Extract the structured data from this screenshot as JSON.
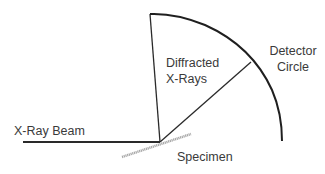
{
  "diagram": {
    "labels": {
      "diffracted_line1": "Diffracted",
      "diffracted_line2": "X-Rays",
      "detector_line1": "Detector",
      "detector_line2": "Circle",
      "beam": "X-Ray Beam",
      "specimen": "Specimen"
    },
    "colors": {
      "lines": "#2a2a2a",
      "specimen": "#a8a8a8",
      "text": "#3a3a3a"
    }
  }
}
